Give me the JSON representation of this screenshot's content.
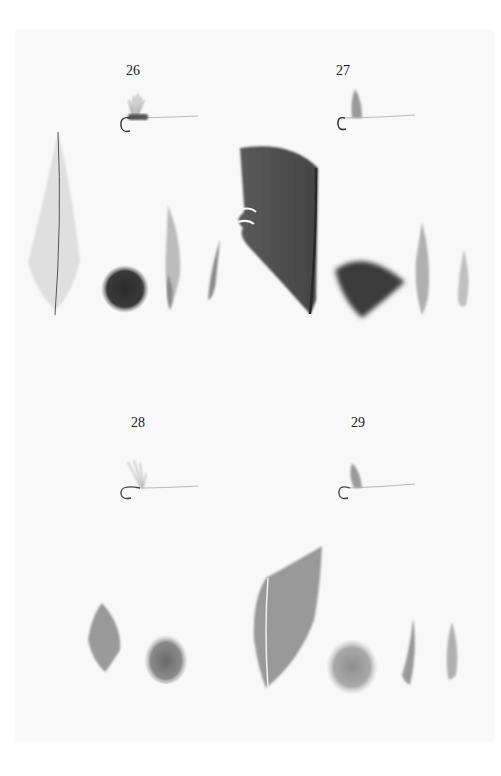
{
  "plate": {
    "background": "#f8f8f8",
    "patterns": [
      {
        "number": "26",
        "components": [
          "fly",
          "long-pale-feather",
          "dark-fur-dubbing",
          "narrow-quill-slip",
          "small-curved-slip"
        ]
      },
      {
        "number": "27",
        "components": [
          "fly",
          "large-dark-wing-quill",
          "dark-hackle-fan",
          "narrow-quill-slip",
          "small-quill-slip"
        ]
      },
      {
        "number": "28",
        "components": [
          "fly",
          "small-oval-feather",
          "medium-fur-dubbing"
        ]
      },
      {
        "number": "29",
        "components": [
          "fly",
          "broad-wing-quill",
          "pale-fur-dubbing",
          "narrow-quill-slip",
          "small-quill-slip"
        ]
      }
    ]
  }
}
